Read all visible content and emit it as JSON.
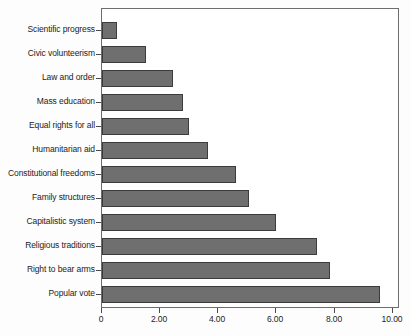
{
  "chart_data": {
    "type": "bar",
    "orientation": "horizontal",
    "title": "",
    "subtitle": "",
    "xlabel": "",
    "ylabel": "",
    "categories": [
      "Scientific progress",
      "Civic volunteerism",
      "Law and order",
      "Mass education",
      "Equal rights for all",
      "Humanitarian aid",
      "Constitutional freedoms",
      "Family structures",
      "Capitalistic system",
      "Religious traditions",
      "Right to bear arms",
      "Popular vote"
    ],
    "values": [
      0.5,
      1.5,
      2.45,
      2.8,
      3.0,
      3.65,
      4.6,
      5.05,
      6.0,
      7.4,
      7.85,
      9.55
    ],
    "xlim": [
      0,
      10.25
    ],
    "xticks": [
      0,
      2,
      4,
      6,
      8,
      10
    ],
    "xtick_labels": [
      "0",
      "2.00",
      "4.00",
      "6.00",
      "8.00",
      "10.00"
    ],
    "grid": false,
    "legend": false,
    "bar_color": "#6f6f6f",
    "bar_border_color": "#3c3c3c",
    "axis_color": "#6d6d6d",
    "background_color": "#ffffff"
  }
}
